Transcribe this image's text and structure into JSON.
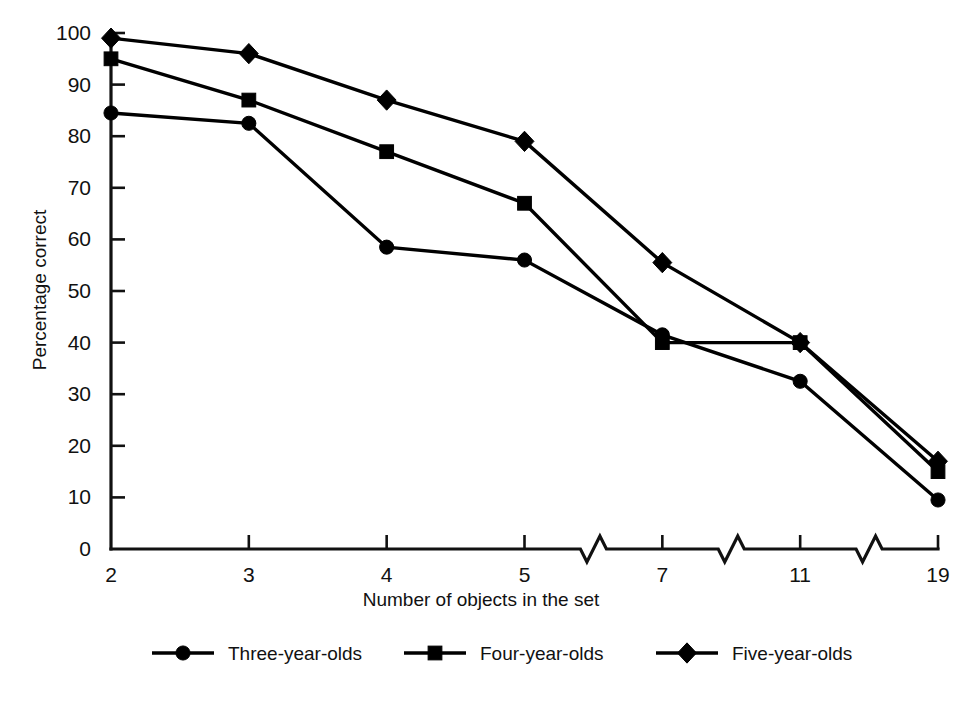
{
  "chart_data": {
    "type": "line",
    "title": "",
    "xlabel": "Number of objects in the set",
    "ylabel": "Percentage correct",
    "categories": [
      "2",
      "3",
      "4",
      "5",
      "7",
      "11",
      "19"
    ],
    "x_tick_labels": [
      "2",
      "3",
      "4",
      "5",
      "7",
      "11",
      "19"
    ],
    "y_tick_labels": [
      "0",
      "10",
      "20",
      "30",
      "40",
      "50",
      "60",
      "70",
      "80",
      "90",
      "100"
    ],
    "y_ticks": [
      0,
      10,
      20,
      30,
      40,
      50,
      60,
      70,
      80,
      90,
      100
    ],
    "ylim": [
      0,
      100
    ],
    "grid": false,
    "x_axis_breaks": [
      {
        "between": "5 and 7"
      },
      {
        "between": "7 and 11"
      },
      {
        "between": "11 and 19"
      }
    ],
    "legend_position": "bottom",
    "series": [
      {
        "name": "Three-year-olds",
        "marker": "circle",
        "color": "#000000",
        "values": [
          84.5,
          82.5,
          58.5,
          56.0,
          41.5,
          32.5,
          9.5
        ]
      },
      {
        "name": "Four-year-olds",
        "marker": "square",
        "color": "#000000",
        "values": [
          95.0,
          87.0,
          77.0,
          67.0,
          40.0,
          40.0,
          15.0
        ]
      },
      {
        "name": "Five-year-olds",
        "marker": "diamond",
        "color": "#000000",
        "values": [
          99.0,
          96.0,
          87.0,
          79.0,
          55.5,
          40.0,
          17.0
        ]
      }
    ]
  },
  "legend": {
    "items": [
      {
        "label": "Three-year-olds",
        "marker": "circle"
      },
      {
        "label": "Four-year-olds",
        "marker": "square"
      },
      {
        "label": "Five-year-olds",
        "marker": "diamond"
      }
    ]
  }
}
